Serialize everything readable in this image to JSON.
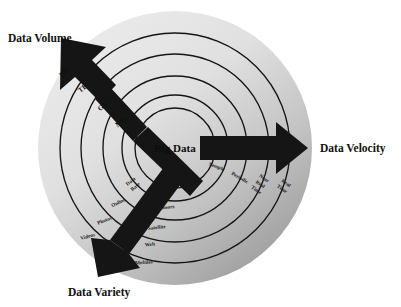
{
  "diagram": {
    "title_center": "Big Data",
    "type": "concentric-radial-3v-diagram",
    "background_color": "#ffffff",
    "disc_color_light": "#e6e6e6",
    "disc_color_dark": "#9a9a9a",
    "ring_stroke_color": "#151515",
    "arrow_color": "#151515",
    "text_color": "#111111",
    "axes": [
      {
        "id": "volume",
        "label": "Data Volume",
        "direction": "up-left",
        "label_x": 8,
        "label_y": 42,
        "rings": [
          {
            "label": "MB",
            "x": 122,
            "y": 124
          },
          {
            "label": "GB",
            "x": 104,
            "y": 108
          },
          {
            "label": "TB",
            "x": 84,
            "y": 90
          },
          {
            "label": "PB",
            "x": 65,
            "y": 75
          }
        ]
      },
      {
        "id": "velocity",
        "label": "Data Velocity",
        "direction": "right",
        "label_x": 320,
        "label_y": 152,
        "rings": [
          {
            "label": "Sample",
            "x": 216,
            "y": 167
          },
          {
            "label": "Periodic",
            "x": 238,
            "y": 178
          },
          {
            "label": "Near Real Time",
            "x": 260,
            "y": 185
          },
          {
            "label": "Real Time",
            "x": 283,
            "y": 188
          }
        ]
      },
      {
        "id": "variety",
        "label": "Data Variety",
        "direction": "down-left",
        "label_x": 68,
        "label_y": 296,
        "rings_inner": [
          {
            "label": "Data Base",
            "x": 131,
            "y": 182
          },
          {
            "label": "Online",
            "x": 117,
            "y": 203
          },
          {
            "label": "Photos",
            "x": 103,
            "y": 221
          },
          {
            "label": "Videos",
            "x": 86,
            "y": 237
          }
        ],
        "rings_outer": [
          {
            "label": "Sensors",
            "x": 162,
            "y": 208
          },
          {
            "label": "Satellite",
            "x": 153,
            "y": 228
          },
          {
            "label": "Web",
            "x": 145,
            "y": 245
          },
          {
            "label": "Mobiles",
            "x": 138,
            "y": 263
          }
        ]
      }
    ],
    "geometry": {
      "center_x": 175,
      "center_y": 148,
      "radii": [
        137,
        115,
        94,
        72,
        53
      ],
      "core_radius": 40
    }
  }
}
